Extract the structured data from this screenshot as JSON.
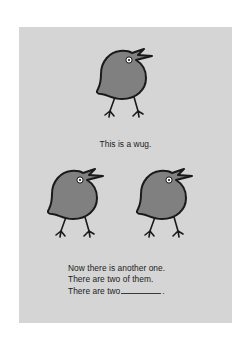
{
  "page": {
    "background_color": "#ffffff",
    "card_background_color": "#d5d5d5"
  },
  "illustration": {
    "creature_name": "wug",
    "body_fill_color": "#808080",
    "outline_color": "#1a1a1a",
    "eye_fill_color": "#ffffff",
    "eye_pupil_color": "#1a1a1a",
    "figures": [
      {
        "id": "wug-top",
        "label": "wug-single",
        "position": "top-center"
      },
      {
        "id": "wug-bottom-left",
        "label": "wug-pair-left",
        "position": "bottom-left"
      },
      {
        "id": "wug-bottom-right",
        "label": "wug-pair-right",
        "position": "bottom-right"
      }
    ]
  },
  "captions": {
    "singular": "This is a wug.",
    "plural_line_1": "Now there is another one.",
    "plural_line_2": "There are two of them.",
    "plural_line_3_prefix": "There are two",
    "plural_line_3_suffix": "."
  }
}
